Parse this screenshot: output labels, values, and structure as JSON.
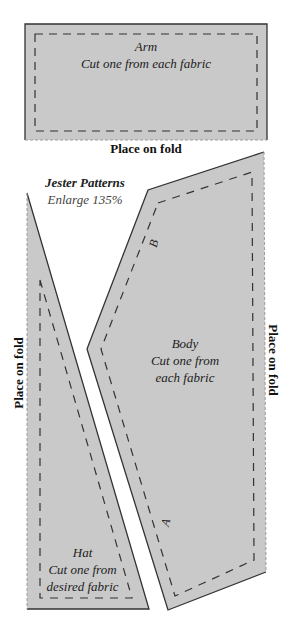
{
  "title": "Jester Patterns",
  "subtitle": "Enlarge 135%",
  "colors": {
    "fill": "#c9c9c9",
    "outline": "#333333",
    "seam": "#333333",
    "fold_edge": "#9a9a9a"
  },
  "pieces": {
    "arm": {
      "name": "Arm",
      "instruction": "Cut one from each fabric",
      "fold_label": "Place on fold"
    },
    "body": {
      "name": "Body",
      "instruction_line1": "Cut one from",
      "instruction_line2": "each fabric",
      "fold_label": "Place on fold",
      "mark_top": "B",
      "mark_bottom": "A"
    },
    "hat": {
      "name": "Hat",
      "instruction_line1": "Cut one from",
      "instruction_line2": "desired fabric",
      "fold_label": "Place on fold"
    }
  }
}
